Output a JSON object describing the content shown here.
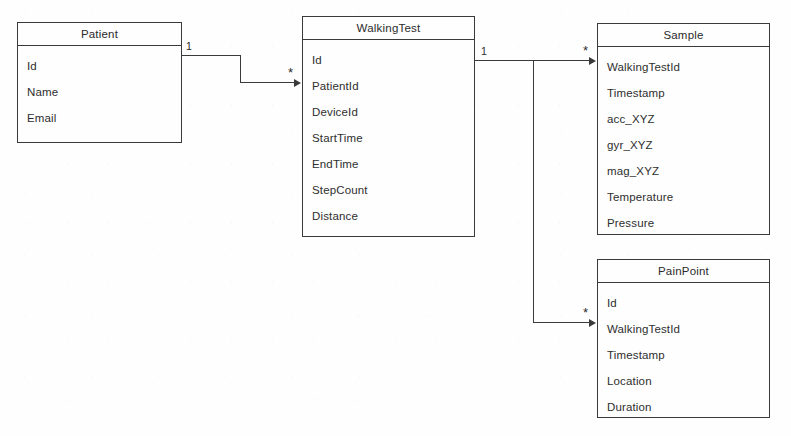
{
  "diagram": {
    "type": "entity-relationship-diagram",
    "background_color": "#fefefe",
    "line_color": "#3a3a3a",
    "text_color": "#2e2e2e"
  },
  "entities": [
    {
      "name": "Patient",
      "attributes": [
        "Id",
        "Name",
        "Email"
      ],
      "box": {
        "x": 17,
        "y": 22,
        "width": 165,
        "height": 121
      }
    },
    {
      "name": "WalkingTest",
      "attributes": [
        "Id",
        "PatientId",
        "DeviceId",
        "StartTime",
        "EndTime",
        "StepCount",
        "Distance"
      ],
      "box": {
        "x": 302,
        "y": 16,
        "width": 173,
        "height": 221
      }
    },
    {
      "name": "Sample",
      "attributes": [
        "WalkingTestId",
        "Timestamp",
        "acc_XYZ",
        "gyr_XYZ",
        "mag_XYZ",
        "Temperature",
        "Pressure"
      ],
      "box": {
        "x": 597,
        "y": 23,
        "width": 173,
        "height": 212
      }
    },
    {
      "name": "PainPoint",
      "attributes": [
        "Id",
        "WalkingTestId",
        "Timestamp",
        "Location",
        "Duration"
      ],
      "box": {
        "x": 597,
        "y": 259,
        "width": 173,
        "height": 159
      }
    }
  ],
  "relationships": [
    {
      "from": "Patient",
      "to": "WalkingTest",
      "from_cardinality": "1",
      "to_cardinality": "*",
      "via_attribute": "PatientId"
    },
    {
      "from": "WalkingTest",
      "to": "Sample",
      "from_cardinality": "1",
      "to_cardinality": "*",
      "via_attribute": "WalkingTestId"
    },
    {
      "from": "WalkingTest",
      "to": "PainPoint",
      "from_cardinality": "1",
      "to_cardinality": "*",
      "via_attribute": "WalkingTestId"
    }
  ],
  "cardinality_labels": {
    "patient_one": "1",
    "walkingtest_many": "*",
    "walkingtest_one": "1",
    "sample_many": "*",
    "painpoint_many": "*"
  }
}
